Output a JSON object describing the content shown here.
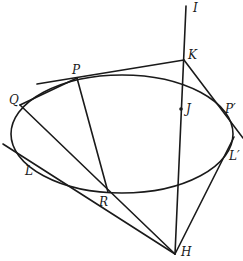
{
  "diagram": {
    "type": "geometry-conic",
    "colors": {
      "stroke": "#1a1a1a",
      "background": "#ffffff"
    },
    "ellipse": {
      "cx": 122,
      "cy": 134,
      "rx": 111,
      "ry": 59
    },
    "points": {
      "I": {
        "label": "I",
        "x": 186,
        "y": 6
      },
      "K": {
        "label": "K",
        "x": 184,
        "y": 60
      },
      "J": {
        "label": "J",
        "x": 181,
        "y": 109
      },
      "P": {
        "label": "P",
        "x": 77,
        "y": 78
      },
      "P_prime": {
        "label": "P′",
        "x": 222,
        "y": 112
      },
      "Q": {
        "label": "Q",
        "x": 20,
        "y": 105
      },
      "L": {
        "label": "L",
        "x": 45,
        "y": 170
      },
      "L_prime": {
        "label": "L′",
        "x": 230,
        "y": 145
      },
      "R": {
        "label": "R",
        "x": 108,
        "y": 192
      },
      "H": {
        "label": "H",
        "x": 175,
        "y": 254
      }
    },
    "segments": [
      {
        "name": "line-I-H",
        "from": [
          186,
          6
        ],
        "to": [
          175,
          254
        ]
      },
      {
        "name": "tangent-at-P-through-K",
        "from": [
          37,
          84
        ],
        "to": [
          184,
          60
        ]
      },
      {
        "name": "line-K-P-prime",
        "from": [
          184,
          60
        ],
        "to": [
          243,
          138
        ]
      },
      {
        "name": "chord-Q-P",
        "from": [
          20,
          105
        ],
        "to": [
          77,
          78
        ]
      },
      {
        "name": "line-Q-R-H",
        "from": [
          20,
          105
        ],
        "to": [
          175,
          254
        ]
      },
      {
        "name": "line-P-R",
        "from": [
          77,
          78
        ],
        "to": [
          108,
          192
        ]
      },
      {
        "name": "tangent-at-L-through-H",
        "from": [
          3,
          144
        ],
        "to": [
          175,
          254
        ]
      },
      {
        "name": "tangent-H-L-prime",
        "from": [
          175,
          254
        ],
        "to": [
          234,
          137
        ]
      }
    ]
  }
}
